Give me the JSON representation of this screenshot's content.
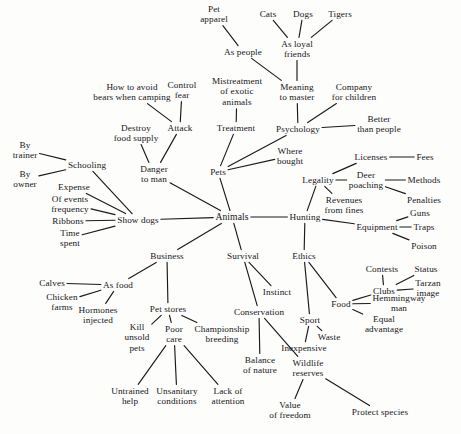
{
  "diagram": {
    "type": "mind-map",
    "background_color": "#fdfdfc",
    "line_color": "#1a1a1a",
    "text_color": "#16161a",
    "nodes": [
      {
        "id": "pet_apparel",
        "label": "Pet\napparel",
        "x": 214,
        "y": 14
      },
      {
        "id": "cats",
        "label": "Cats",
        "x": 268,
        "y": 14
      },
      {
        "id": "dogs",
        "label": "Dogs",
        "x": 303,
        "y": 14
      },
      {
        "id": "tigers",
        "label": "Tigers",
        "x": 340,
        "y": 14
      },
      {
        "id": "as_people",
        "label": "As people",
        "x": 243,
        "y": 52
      },
      {
        "id": "as_loyal_friends",
        "label": "As loyal\nfriends",
        "x": 297,
        "y": 49
      },
      {
        "id": "how_to_avoid_bears",
        "label": "How to avoid\nbears when camping",
        "x": 132,
        "y": 92
      },
      {
        "id": "control_fear",
        "label": "Control\nfear",
        "x": 182,
        "y": 90
      },
      {
        "id": "mistreatment_exotic",
        "label": "Mistreatment\nof exotic\nanimals",
        "x": 237,
        "y": 92
      },
      {
        "id": "meaning_to_master",
        "label": "Meaning\nto master",
        "x": 297,
        "y": 92
      },
      {
        "id": "company_for_children",
        "label": "Company\nfor children",
        "x": 354,
        "y": 92
      },
      {
        "id": "destroy_food_supply",
        "label": "Destroy\nfood supply",
        "x": 136,
        "y": 133
      },
      {
        "id": "attack",
        "label": "Attack",
        "x": 180,
        "y": 128
      },
      {
        "id": "treatment",
        "label": "Treatment",
        "x": 236,
        "y": 128
      },
      {
        "id": "psychology",
        "label": "Psychology",
        "x": 298,
        "y": 129
      },
      {
        "id": "better_than_people",
        "label": "Better\nthan people",
        "x": 379,
        "y": 124
      },
      {
        "id": "by_trainer",
        "label": "By\ntrainer",
        "x": 25,
        "y": 150
      },
      {
        "id": "where_bought",
        "label": "Where\nbought",
        "x": 290,
        "y": 156
      },
      {
        "id": "licenses",
        "label": "Licenses",
        "x": 371,
        "y": 157
      },
      {
        "id": "fees",
        "label": "Fees",
        "x": 425,
        "y": 157
      },
      {
        "id": "by_owner",
        "label": "By\nowner",
        "x": 25,
        "y": 179
      },
      {
        "id": "schooling",
        "label": "Schooling",
        "x": 87,
        "y": 165
      },
      {
        "id": "danger_to_man",
        "label": "Danger\nto man",
        "x": 154,
        "y": 174
      },
      {
        "id": "pets",
        "label": "Pets",
        "x": 218,
        "y": 172
      },
      {
        "id": "legality",
        "label": "Legality",
        "x": 318,
        "y": 180
      },
      {
        "id": "deer_poaching",
        "label": "Deer\npoaching",
        "x": 366,
        "y": 180
      },
      {
        "id": "methods",
        "label": "Methods",
        "x": 424,
        "y": 180
      },
      {
        "id": "expense",
        "label": "Expense",
        "x": 74,
        "y": 187
      },
      {
        "id": "penalties",
        "label": "Penalties",
        "x": 424,
        "y": 200
      },
      {
        "id": "of_events_frequency",
        "label": "Of events\nfrequency",
        "x": 70,
        "y": 204
      },
      {
        "id": "revenues_from_fines",
        "label": "Revenues\nfrom fines",
        "x": 344,
        "y": 205
      },
      {
        "id": "guns",
        "label": "Guns",
        "x": 420,
        "y": 213
      },
      {
        "id": "ribbons",
        "label": "Ribbons",
        "x": 68,
        "y": 221
      },
      {
        "id": "show_dogs",
        "label": "Show dogs",
        "x": 138,
        "y": 220
      },
      {
        "id": "animals",
        "label": "Animals",
        "x": 232,
        "y": 217
      },
      {
        "id": "hunting",
        "label": "Hunting",
        "x": 305,
        "y": 217
      },
      {
        "id": "equipment",
        "label": "Equipment",
        "x": 377,
        "y": 227
      },
      {
        "id": "traps",
        "label": "Traps",
        "x": 424,
        "y": 227
      },
      {
        "id": "time_spent",
        "label": "Time\nspent",
        "x": 70,
        "y": 238
      },
      {
        "id": "poison",
        "label": "Poison",
        "x": 424,
        "y": 246
      },
      {
        "id": "business",
        "label": "Business",
        "x": 167,
        "y": 256
      },
      {
        "id": "survival",
        "label": "Survival",
        "x": 243,
        "y": 256
      },
      {
        "id": "ethics",
        "label": "Ethics",
        "x": 304,
        "y": 256
      },
      {
        "id": "contests",
        "label": "Contests",
        "x": 382,
        "y": 269
      },
      {
        "id": "status",
        "label": "Status",
        "x": 426,
        "y": 269
      },
      {
        "id": "calves",
        "label": "Calves",
        "x": 52,
        "y": 283
      },
      {
        "id": "as_food",
        "label": "As food",
        "x": 118,
        "y": 285
      },
      {
        "id": "instinct",
        "label": "Instinct",
        "x": 277,
        "y": 292
      },
      {
        "id": "clubs",
        "label": "Clubs",
        "x": 384,
        "y": 291
      },
      {
        "id": "tarzan_image",
        "label": "Tarzan\nimage",
        "x": 428,
        "y": 288
      },
      {
        "id": "chicken_farms",
        "label": "Chicken\nfarms",
        "x": 62,
        "y": 302
      },
      {
        "id": "food",
        "label": "Food",
        "x": 341,
        "y": 304
      },
      {
        "id": "hemmingway_man",
        "label": "Hemmingway\nman",
        "x": 399,
        "y": 303
      },
      {
        "id": "hormones_injected",
        "label": "Hormones\ninjected",
        "x": 98,
        "y": 315
      },
      {
        "id": "pet_stores",
        "label": "Pet stores",
        "x": 168,
        "y": 309
      },
      {
        "id": "conservation",
        "label": "Conservation",
        "x": 259,
        "y": 312
      },
      {
        "id": "sport",
        "label": "Sport",
        "x": 310,
        "y": 320
      },
      {
        "id": "equal_advantage",
        "label": "Equal\nadvantage",
        "x": 384,
        "y": 324
      },
      {
        "id": "kill_unsold_pets",
        "label": "Kill\nunsold\npets",
        "x": 137,
        "y": 338
      },
      {
        "id": "poor_care",
        "label": "Poor\ncare",
        "x": 174,
        "y": 334
      },
      {
        "id": "championship_breeding",
        "label": "Championship\nbreeding",
        "x": 222,
        "y": 334
      },
      {
        "id": "waste",
        "label": "Waste",
        "x": 329,
        "y": 337
      },
      {
        "id": "inexpensive",
        "label": "Inexpensive",
        "x": 304,
        "y": 348
      },
      {
        "id": "balance_of_nature",
        "label": "Balance\nof nature",
        "x": 260,
        "y": 365
      },
      {
        "id": "wildlife_reserves",
        "label": "Wildlife\nreserves",
        "x": 308,
        "y": 368
      },
      {
        "id": "untrained_help",
        "label": "Untrained\nhelp",
        "x": 130,
        "y": 396
      },
      {
        "id": "unsanitary_conditions",
        "label": "Unsanitary\nconditions",
        "x": 177,
        "y": 396
      },
      {
        "id": "lack_of_attention",
        "label": "Lack of\nattention",
        "x": 228,
        "y": 396
      },
      {
        "id": "value_of_freedom",
        "label": "Value\nof freedom",
        "x": 290,
        "y": 410
      },
      {
        "id": "protect_species",
        "label": "Protect species",
        "x": 380,
        "y": 412
      }
    ],
    "edges": [
      [
        "pet_apparel",
        "as_people"
      ],
      [
        "cats",
        "as_loyal_friends"
      ],
      [
        "dogs",
        "as_loyal_friends"
      ],
      [
        "tigers",
        "as_loyal_friends"
      ],
      [
        "as_people",
        "meaning_to_master"
      ],
      [
        "as_loyal_friends",
        "meaning_to_master"
      ],
      [
        "meaning_to_master",
        "psychology"
      ],
      [
        "company_for_children",
        "psychology"
      ],
      [
        "better_than_people",
        "psychology"
      ],
      [
        "psychology",
        "pets"
      ],
      [
        "mistreatment_exotic",
        "treatment"
      ],
      [
        "treatment",
        "pets"
      ],
      [
        "where_bought",
        "pets"
      ],
      [
        "pets",
        "animals"
      ],
      [
        "how_to_avoid_bears",
        "attack"
      ],
      [
        "control_fear",
        "attack"
      ],
      [
        "attack",
        "danger_to_man"
      ],
      [
        "destroy_food_supply",
        "danger_to_man"
      ],
      [
        "danger_to_man",
        "animals"
      ],
      [
        "by_trainer",
        "schooling"
      ],
      [
        "by_owner",
        "schooling"
      ],
      [
        "schooling",
        "show_dogs"
      ],
      [
        "expense",
        "show_dogs"
      ],
      [
        "of_events_frequency",
        "show_dogs"
      ],
      [
        "ribbons",
        "show_dogs"
      ],
      [
        "time_spent",
        "show_dogs"
      ],
      [
        "show_dogs",
        "animals"
      ],
      [
        "animals",
        "business"
      ],
      [
        "animals",
        "survival"
      ],
      [
        "animals",
        "hunting"
      ],
      [
        "hunting",
        "legality"
      ],
      [
        "legality",
        "licenses"
      ],
      [
        "licenses",
        "fees"
      ],
      [
        "legality",
        "deer_poaching"
      ],
      [
        "deer_poaching",
        "methods"
      ],
      [
        "deer_poaching",
        "penalties"
      ],
      [
        "legality",
        "revenues_from_fines"
      ],
      [
        "hunting",
        "equipment"
      ],
      [
        "equipment",
        "guns"
      ],
      [
        "equipment",
        "traps"
      ],
      [
        "equipment",
        "poison"
      ],
      [
        "hunting",
        "ethics"
      ],
      [
        "ethics",
        "food"
      ],
      [
        "ethics",
        "sport"
      ],
      [
        "food",
        "clubs"
      ],
      [
        "clubs",
        "contests"
      ],
      [
        "clubs",
        "status"
      ],
      [
        "clubs",
        "tarzan_image"
      ],
      [
        "food",
        "hemmingway_man"
      ],
      [
        "food",
        "equal_advantage"
      ],
      [
        "sport",
        "waste"
      ],
      [
        "sport",
        "inexpensive"
      ],
      [
        "survival",
        "instinct"
      ],
      [
        "survival",
        "conservation"
      ],
      [
        "conservation",
        "balance_of_nature"
      ],
      [
        "conservation",
        "wildlife_reserves"
      ],
      [
        "wildlife_reserves",
        "value_of_freedom"
      ],
      [
        "wildlife_reserves",
        "protect_species"
      ],
      [
        "business",
        "as_food"
      ],
      [
        "as_food",
        "calves"
      ],
      [
        "as_food",
        "chicken_farms"
      ],
      [
        "as_food",
        "hormones_injected"
      ],
      [
        "business",
        "pet_stores"
      ],
      [
        "pet_stores",
        "kill_unsold_pets"
      ],
      [
        "pet_stores",
        "poor_care"
      ],
      [
        "pet_stores",
        "championship_breeding"
      ],
      [
        "poor_care",
        "untrained_help"
      ],
      [
        "poor_care",
        "unsanitary_conditions"
      ],
      [
        "poor_care",
        "lack_of_attention"
      ]
    ]
  }
}
